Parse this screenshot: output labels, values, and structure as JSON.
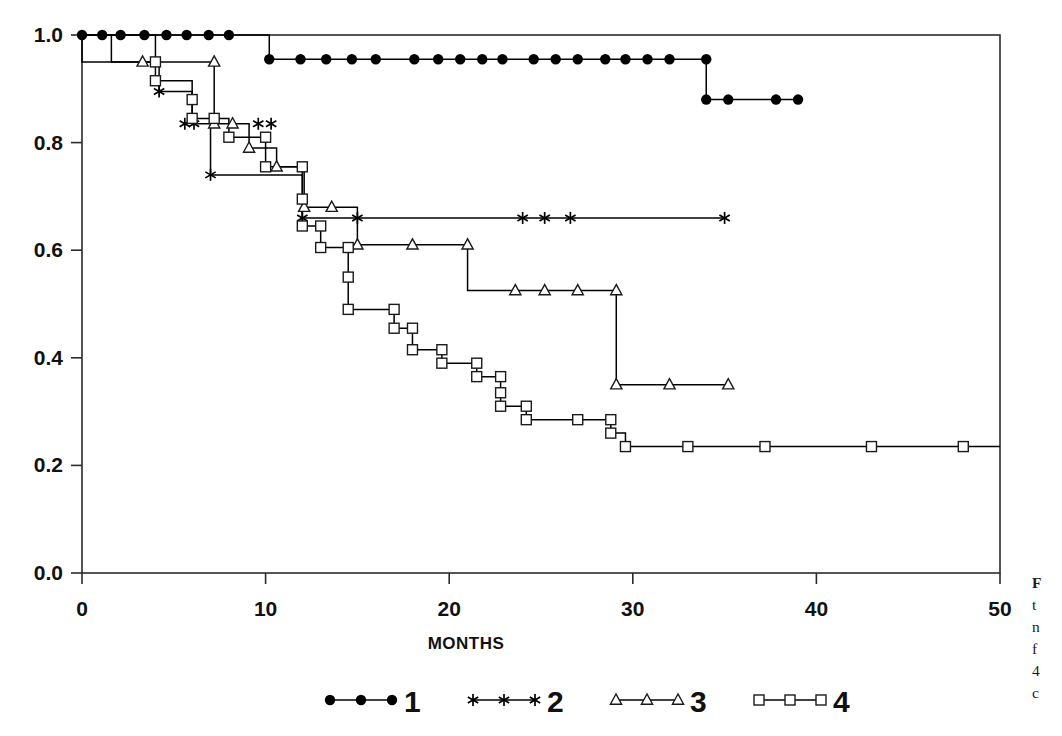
{
  "chart_data": {
    "type": "line",
    "subtype": "kaplan-meier-step",
    "title": "",
    "xlabel": "MONTHS",
    "ylabel": "",
    "xlim": [
      0,
      50
    ],
    "ylim": [
      0.0,
      1.0
    ],
    "xticks": [
      0,
      10,
      20,
      30,
      40,
      50
    ],
    "xtick_labels": [
      "0",
      "10",
      "20",
      "30",
      "40",
      "50"
    ],
    "yticks": [
      0.0,
      0.2,
      0.4,
      0.6,
      0.8,
      1.0
    ],
    "ytick_labels": [
      "0.0",
      "0.2",
      "0.4",
      "0.6",
      "0.8",
      "1.0"
    ],
    "grid": false,
    "legend_position": "below-axes-center",
    "frame": "full-box",
    "series": [
      {
        "name": "1",
        "label": "1",
        "marker": "filled-circle",
        "color": "#000000",
        "steps": [
          {
            "x": 0.0,
            "y": 1.0
          },
          {
            "x": 10.2,
            "y": 1.0
          },
          {
            "x": 10.2,
            "y": 0.955
          },
          {
            "x": 34.0,
            "y": 0.955
          },
          {
            "x": 34.0,
            "y": 0.88
          },
          {
            "x": 39.0,
            "y": 0.88
          }
        ],
        "points": [
          {
            "x": 0.0,
            "y": 1.0
          },
          {
            "x": 1.1,
            "y": 1.0
          },
          {
            "x": 2.1,
            "y": 1.0
          },
          {
            "x": 3.4,
            "y": 1.0
          },
          {
            "x": 4.6,
            "y": 1.0
          },
          {
            "x": 5.7,
            "y": 1.0
          },
          {
            "x": 6.9,
            "y": 1.0
          },
          {
            "x": 8.0,
            "y": 1.0
          },
          {
            "x": 10.2,
            "y": 0.955
          },
          {
            "x": 11.9,
            "y": 0.955
          },
          {
            "x": 13.3,
            "y": 0.955
          },
          {
            "x": 14.7,
            "y": 0.955
          },
          {
            "x": 16.0,
            "y": 0.955
          },
          {
            "x": 18.1,
            "y": 0.955
          },
          {
            "x": 19.4,
            "y": 0.955
          },
          {
            "x": 20.6,
            "y": 0.955
          },
          {
            "x": 21.8,
            "y": 0.955
          },
          {
            "x": 22.9,
            "y": 0.955
          },
          {
            "x": 24.6,
            "y": 0.955
          },
          {
            "x": 25.8,
            "y": 0.955
          },
          {
            "x": 27.0,
            "y": 0.955
          },
          {
            "x": 28.5,
            "y": 0.955
          },
          {
            "x": 29.6,
            "y": 0.955
          },
          {
            "x": 30.8,
            "y": 0.955
          },
          {
            "x": 32.0,
            "y": 0.955
          },
          {
            "x": 34.0,
            "y": 0.955
          },
          {
            "x": 34.0,
            "y": 0.88
          },
          {
            "x": 35.2,
            "y": 0.88
          },
          {
            "x": 37.8,
            "y": 0.88
          },
          {
            "x": 39.0,
            "y": 0.88
          }
        ]
      },
      {
        "name": "2",
        "label": "2",
        "marker": "asterisk",
        "color": "#000000",
        "steps": [
          {
            "x": 0.0,
            "y": 1.0
          },
          {
            "x": 0.0,
            "y": 0.95
          },
          {
            "x": 4.2,
            "y": 0.95
          },
          {
            "x": 4.2,
            "y": 0.895
          },
          {
            "x": 6.0,
            "y": 0.895
          },
          {
            "x": 6.0,
            "y": 0.835
          },
          {
            "x": 7.0,
            "y": 0.835
          },
          {
            "x": 7.0,
            "y": 0.74
          },
          {
            "x": 7.0,
            "y": 0.74
          },
          {
            "x": 12.0,
            "y": 0.74
          },
          {
            "x": 12.0,
            "y": 0.66
          },
          {
            "x": 35.0,
            "y": 0.66
          }
        ],
        "points": [
          {
            "x": 4.2,
            "y": 0.895
          },
          {
            "x": 5.6,
            "y": 0.835
          },
          {
            "x": 6.1,
            "y": 0.835
          },
          {
            "x": 7.0,
            "y": 0.74
          },
          {
            "x": 9.6,
            "y": 0.835
          },
          {
            "x": 10.3,
            "y": 0.835
          },
          {
            "x": 12.0,
            "y": 0.66
          },
          {
            "x": 15.0,
            "y": 0.66
          },
          {
            "x": 24.0,
            "y": 0.66
          },
          {
            "x": 25.2,
            "y": 0.66
          },
          {
            "x": 26.6,
            "y": 0.66
          },
          {
            "x": 35.0,
            "y": 0.66
          }
        ]
      },
      {
        "name": "3",
        "label": "3",
        "marker": "open-triangle",
        "color": "#000000",
        "steps": [
          {
            "x": 0.0,
            "y": 1.0
          },
          {
            "x": 1.6,
            "y": 1.0
          },
          {
            "x": 1.6,
            "y": 0.95
          },
          {
            "x": 7.2,
            "y": 0.95
          },
          {
            "x": 7.2,
            "y": 0.835
          },
          {
            "x": 9.1,
            "y": 0.835
          },
          {
            "x": 9.1,
            "y": 0.79
          },
          {
            "x": 10.6,
            "y": 0.79
          },
          {
            "x": 10.6,
            "y": 0.755
          },
          {
            "x": 12.1,
            "y": 0.755
          },
          {
            "x": 12.1,
            "y": 0.68
          },
          {
            "x": 15.0,
            "y": 0.68
          },
          {
            "x": 15.0,
            "y": 0.61
          },
          {
            "x": 21.0,
            "y": 0.61
          },
          {
            "x": 21.0,
            "y": 0.525
          },
          {
            "x": 29.1,
            "y": 0.525
          },
          {
            "x": 29.1,
            "y": 0.35
          },
          {
            "x": 35.2,
            "y": 0.35
          }
        ],
        "points": [
          {
            "x": 3.3,
            "y": 0.95
          },
          {
            "x": 7.2,
            "y": 0.95
          },
          {
            "x": 7.2,
            "y": 0.835
          },
          {
            "x": 8.2,
            "y": 0.835
          },
          {
            "x": 9.1,
            "y": 0.79
          },
          {
            "x": 10.6,
            "y": 0.755
          },
          {
            "x": 12.1,
            "y": 0.68
          },
          {
            "x": 13.6,
            "y": 0.68
          },
          {
            "x": 15.0,
            "y": 0.61
          },
          {
            "x": 18.0,
            "y": 0.61
          },
          {
            "x": 21.0,
            "y": 0.61
          },
          {
            "x": 23.6,
            "y": 0.525
          },
          {
            "x": 25.2,
            "y": 0.525
          },
          {
            "x": 27.0,
            "y": 0.525
          },
          {
            "x": 29.1,
            "y": 0.525
          },
          {
            "x": 29.1,
            "y": 0.35
          },
          {
            "x": 32.0,
            "y": 0.35
          },
          {
            "x": 35.2,
            "y": 0.35
          }
        ]
      },
      {
        "name": "4",
        "label": "4",
        "marker": "open-square",
        "color": "#000000",
        "steps": [
          {
            "x": 0.0,
            "y": 1.0
          },
          {
            "x": 4.0,
            "y": 1.0
          },
          {
            "x": 4.0,
            "y": 0.95
          },
          {
            "x": 4.0,
            "y": 0.915
          },
          {
            "x": 6.0,
            "y": 0.915
          },
          {
            "x": 6.0,
            "y": 0.88
          },
          {
            "x": 6.0,
            "y": 0.845
          },
          {
            "x": 8.0,
            "y": 0.845
          },
          {
            "x": 8.0,
            "y": 0.81
          },
          {
            "x": 10.0,
            "y": 0.81
          },
          {
            "x": 10.0,
            "y": 0.755
          },
          {
            "x": 12.0,
            "y": 0.755
          },
          {
            "x": 12.0,
            "y": 0.695
          },
          {
            "x": 12.0,
            "y": 0.645
          },
          {
            "x": 13.0,
            "y": 0.645
          },
          {
            "x": 13.0,
            "y": 0.605
          },
          {
            "x": 14.5,
            "y": 0.605
          },
          {
            "x": 14.5,
            "y": 0.55
          },
          {
            "x": 14.5,
            "y": 0.49
          },
          {
            "x": 17.0,
            "y": 0.49
          },
          {
            "x": 17.0,
            "y": 0.455
          },
          {
            "x": 18.0,
            "y": 0.455
          },
          {
            "x": 18.0,
            "y": 0.415
          },
          {
            "x": 19.6,
            "y": 0.415
          },
          {
            "x": 19.6,
            "y": 0.39
          },
          {
            "x": 21.5,
            "y": 0.39
          },
          {
            "x": 21.5,
            "y": 0.365
          },
          {
            "x": 22.8,
            "y": 0.365
          },
          {
            "x": 22.8,
            "y": 0.335
          },
          {
            "x": 22.8,
            "y": 0.31
          },
          {
            "x": 24.2,
            "y": 0.31
          },
          {
            "x": 24.2,
            "y": 0.285
          },
          {
            "x": 27.0,
            "y": 0.285
          },
          {
            "x": 28.8,
            "y": 0.285
          },
          {
            "x": 28.8,
            "y": 0.26
          },
          {
            "x": 29.6,
            "y": 0.26
          },
          {
            "x": 29.6,
            "y": 0.235
          },
          {
            "x": 50.0,
            "y": 0.235
          }
        ],
        "points": [
          {
            "x": 4.0,
            "y": 0.95
          },
          {
            "x": 4.0,
            "y": 0.915
          },
          {
            "x": 6.0,
            "y": 0.88
          },
          {
            "x": 6.0,
            "y": 0.845
          },
          {
            "x": 7.2,
            "y": 0.845
          },
          {
            "x": 8.0,
            "y": 0.81
          },
          {
            "x": 10.0,
            "y": 0.81
          },
          {
            "x": 10.0,
            "y": 0.755
          },
          {
            "x": 12.0,
            "y": 0.755
          },
          {
            "x": 12.0,
            "y": 0.695
          },
          {
            "x": 12.0,
            "y": 0.645
          },
          {
            "x": 13.0,
            "y": 0.645
          },
          {
            "x": 13.0,
            "y": 0.605
          },
          {
            "x": 14.5,
            "y": 0.605
          },
          {
            "x": 14.5,
            "y": 0.55
          },
          {
            "x": 14.5,
            "y": 0.49
          },
          {
            "x": 17.0,
            "y": 0.49
          },
          {
            "x": 17.0,
            "y": 0.455
          },
          {
            "x": 18.0,
            "y": 0.455
          },
          {
            "x": 18.0,
            "y": 0.415
          },
          {
            "x": 19.6,
            "y": 0.415
          },
          {
            "x": 19.6,
            "y": 0.39
          },
          {
            "x": 21.5,
            "y": 0.39
          },
          {
            "x": 21.5,
            "y": 0.365
          },
          {
            "x": 22.8,
            "y": 0.365
          },
          {
            "x": 22.8,
            "y": 0.335
          },
          {
            "x": 22.8,
            "y": 0.31
          },
          {
            "x": 24.2,
            "y": 0.31
          },
          {
            "x": 24.2,
            "y": 0.285
          },
          {
            "x": 27.0,
            "y": 0.285
          },
          {
            "x": 28.8,
            "y": 0.285
          },
          {
            "x": 28.8,
            "y": 0.26
          },
          {
            "x": 29.6,
            "y": 0.235
          },
          {
            "x": 33.0,
            "y": 0.235
          },
          {
            "x": 37.2,
            "y": 0.235
          },
          {
            "x": 43.0,
            "y": 0.235
          },
          {
            "x": 48.0,
            "y": 0.235
          }
        ]
      }
    ]
  },
  "axes": {
    "x_title": "MONTHS"
  },
  "legend": {
    "entries": [
      {
        "label": "1",
        "marker": "filled-circle"
      },
      {
        "label": "2",
        "marker": "asterisk"
      },
      {
        "label": "3",
        "marker": "open-triangle"
      },
      {
        "label": "4",
        "marker": "open-square"
      }
    ]
  },
  "caption": {
    "lines": [
      "F",
      "t",
      "n",
      "f",
      "4",
      "c"
    ]
  }
}
